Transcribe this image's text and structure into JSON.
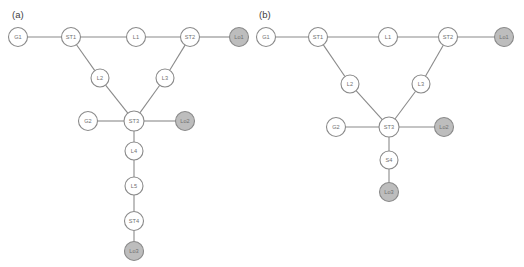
{
  "figure": {
    "width": 524,
    "height": 267,
    "background": "#ffffff",
    "edge_color": "#8a8a8a",
    "bus_node_fill": "#ffffff",
    "load_node_fill": "#bdbdbd",
    "node_border_color": "#8a8a8a",
    "label_color": "#707070",
    "panel_label_color": "#3d3d3d"
  },
  "panels": [
    {
      "id": "panel-a",
      "label": "(a)",
      "label_x": 12,
      "label_y": 14,
      "nodes": [
        {
          "id": "a-G1",
          "name": "G1",
          "x": 18,
          "y": 37,
          "r": 9.5,
          "type": "bus"
        },
        {
          "id": "a-ST1",
          "name": "ST1",
          "x": 71,
          "y": 37,
          "r": 9.5,
          "type": "bus"
        },
        {
          "id": "a-L1",
          "name": "L1",
          "x": 136,
          "y": 37,
          "r": 9.5,
          "type": "bus"
        },
        {
          "id": "a-ST2",
          "name": "ST2",
          "x": 190,
          "y": 37,
          "r": 9.5,
          "type": "bus"
        },
        {
          "id": "a-Lo1",
          "name": "Lo1",
          "x": 239,
          "y": 37,
          "r": 9.5,
          "type": "load"
        },
        {
          "id": "a-L2",
          "name": "L2",
          "x": 100,
          "y": 78,
          "r": 9.0,
          "type": "bus"
        },
        {
          "id": "a-L3",
          "name": "L3",
          "x": 165,
          "y": 78,
          "r": 9.0,
          "type": "bus"
        },
        {
          "id": "a-G2",
          "name": "G2",
          "x": 88,
          "y": 121,
          "r": 9.5,
          "type": "bus"
        },
        {
          "id": "a-ST3",
          "name": "ST3",
          "x": 134,
          "y": 121,
          "r": 10.0,
          "type": "bus"
        },
        {
          "id": "a-Lo2",
          "name": "Lo2",
          "x": 185,
          "y": 121,
          "r": 9.5,
          "type": "load"
        },
        {
          "id": "a-L4",
          "name": "L4",
          "x": 134,
          "y": 151,
          "r": 9.0,
          "type": "bus"
        },
        {
          "id": "a-L5",
          "name": "L5",
          "x": 134,
          "y": 186,
          "r": 9.0,
          "type": "bus"
        },
        {
          "id": "a-ST4",
          "name": "ST4",
          "x": 134,
          "y": 221,
          "r": 9.5,
          "type": "bus"
        },
        {
          "id": "a-Lo3",
          "name": "Lo3",
          "x": 134,
          "y": 251,
          "r": 9.5,
          "type": "load"
        }
      ],
      "edges": [
        {
          "from": "a-G1",
          "to": "a-ST1"
        },
        {
          "from": "a-ST1",
          "to": "a-L1"
        },
        {
          "from": "a-L1",
          "to": "a-ST2"
        },
        {
          "from": "a-ST2",
          "to": "a-Lo1"
        },
        {
          "from": "a-ST1",
          "to": "a-L2"
        },
        {
          "from": "a-L2",
          "to": "a-ST3"
        },
        {
          "from": "a-ST2",
          "to": "a-L3"
        },
        {
          "from": "a-L3",
          "to": "a-ST3"
        },
        {
          "from": "a-G2",
          "to": "a-ST3"
        },
        {
          "from": "a-ST3",
          "to": "a-Lo2"
        },
        {
          "from": "a-ST3",
          "to": "a-L4"
        },
        {
          "from": "a-L4",
          "to": "a-L5"
        },
        {
          "from": "a-L5",
          "to": "a-ST4"
        },
        {
          "from": "a-ST4",
          "to": "a-Lo3"
        }
      ]
    },
    {
      "id": "panel-b",
      "label": "(b)",
      "label_x": 259,
      "label_y": 14,
      "nodes": [
        {
          "id": "b-G1",
          "name": "G1",
          "x": 266,
          "y": 37,
          "r": 9.5,
          "type": "bus"
        },
        {
          "id": "b-ST1",
          "name": "ST1",
          "x": 318,
          "y": 37,
          "r": 9.5,
          "type": "bus"
        },
        {
          "id": "b-L1",
          "name": "L1",
          "x": 388,
          "y": 37,
          "r": 9.5,
          "type": "bus"
        },
        {
          "id": "b-ST2",
          "name": "ST2",
          "x": 448,
          "y": 37,
          "r": 9.5,
          "type": "bus"
        },
        {
          "id": "b-Lo1",
          "name": "Lo1",
          "x": 504,
          "y": 37,
          "r": 9.5,
          "type": "load"
        },
        {
          "id": "b-L2",
          "name": "L2",
          "x": 350,
          "y": 84,
          "r": 9.0,
          "type": "bus"
        },
        {
          "id": "b-L3",
          "name": "L3",
          "x": 421,
          "y": 84,
          "r": 9.0,
          "type": "bus"
        },
        {
          "id": "b-G2",
          "name": "G2",
          "x": 336,
          "y": 127,
          "r": 9.5,
          "type": "bus"
        },
        {
          "id": "b-ST3",
          "name": "ST3",
          "x": 389,
          "y": 127,
          "r": 10.0,
          "type": "bus"
        },
        {
          "id": "b-Lo2",
          "name": "Lo2",
          "x": 444,
          "y": 127,
          "r": 9.5,
          "type": "load"
        },
        {
          "id": "b-S4",
          "name": "S4",
          "x": 389,
          "y": 160,
          "r": 9.0,
          "type": "bus"
        },
        {
          "id": "b-Lo3",
          "name": "Lo3",
          "x": 389,
          "y": 192,
          "r": 9.5,
          "type": "load"
        }
      ],
      "edges": [
        {
          "from": "b-G1",
          "to": "b-ST1"
        },
        {
          "from": "b-ST1",
          "to": "b-L1"
        },
        {
          "from": "b-L1",
          "to": "b-ST2"
        },
        {
          "from": "b-ST2",
          "to": "b-Lo1"
        },
        {
          "from": "b-ST1",
          "to": "b-L2"
        },
        {
          "from": "b-L2",
          "to": "b-ST3"
        },
        {
          "from": "b-ST2",
          "to": "b-L3"
        },
        {
          "from": "b-L3",
          "to": "b-ST3"
        },
        {
          "from": "b-G2",
          "to": "b-ST3"
        },
        {
          "from": "b-ST3",
          "to": "b-Lo2"
        },
        {
          "from": "b-ST3",
          "to": "b-S4"
        },
        {
          "from": "b-S4",
          "to": "b-Lo3"
        }
      ]
    }
  ]
}
